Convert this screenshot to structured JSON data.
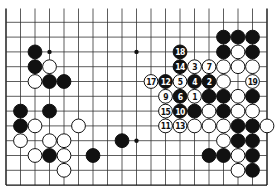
{
  "board": {
    "cols": 19,
    "rows": 13,
    "origin_x": 6,
    "origin_y": 7.5,
    "spacing_x": 14.5,
    "spacing_y": 14.8,
    "top_edge_drawn": false,
    "bottom_edge_row": 12,
    "left_edge_col": 0,
    "right_edge_col": 18,
    "first_horizontal_row": 1,
    "line_color": "#333333",
    "edge_color": "#111111",
    "stone_radius": 6.9
  },
  "star_points": [
    {
      "c": 3,
      "r": 3
    },
    {
      "c": 9,
      "r": 3
    },
    {
      "c": 9,
      "r": 9
    }
  ],
  "stones": [
    {
      "c": 2,
      "r": 3,
      "color": "black"
    },
    {
      "c": 2,
      "r": 4,
      "color": "black"
    },
    {
      "c": 3,
      "r": 4,
      "color": "white"
    },
    {
      "c": 2,
      "r": 5,
      "color": "white"
    },
    {
      "c": 3,
      "r": 5,
      "color": "black"
    },
    {
      "c": 4,
      "r": 5,
      "color": "black"
    },
    {
      "c": 15,
      "r": 2,
      "color": "black"
    },
    {
      "c": 16,
      "r": 2,
      "color": "black"
    },
    {
      "c": 17,
      "r": 2,
      "color": "black"
    },
    {
      "c": 12,
      "r": 3,
      "color": "black",
      "label": "18"
    },
    {
      "c": 15,
      "r": 3,
      "color": "black"
    },
    {
      "c": 16,
      "r": 3,
      "color": "white"
    },
    {
      "c": 17,
      "r": 3,
      "color": "black"
    },
    {
      "c": 12,
      "r": 4,
      "color": "black",
      "label": "14"
    },
    {
      "c": 13,
      "r": 4,
      "color": "white",
      "label": "3"
    },
    {
      "c": 14,
      "r": 4,
      "color": "white",
      "label": "7"
    },
    {
      "c": 15,
      "r": 4,
      "color": "white"
    },
    {
      "c": 16,
      "r": 4,
      "color": "white"
    },
    {
      "c": 17,
      "r": 4,
      "color": "white"
    },
    {
      "c": 10,
      "r": 5,
      "color": "white",
      "label": "17"
    },
    {
      "c": 11,
      "r": 5,
      "color": "black",
      "label": "12"
    },
    {
      "c": 12,
      "r": 5,
      "color": "white",
      "label": "5"
    },
    {
      "c": 13,
      "r": 5,
      "color": "black",
      "label": "4"
    },
    {
      "c": 14,
      "r": 5,
      "color": "black",
      "label": "2"
    },
    {
      "c": 15,
      "r": 5,
      "color": "white"
    },
    {
      "c": 17,
      "r": 5,
      "color": "white",
      "label": "19"
    },
    {
      "c": 11,
      "r": 6,
      "color": "white",
      "label": "9"
    },
    {
      "c": 12,
      "r": 6,
      "color": "black",
      "label": "6"
    },
    {
      "c": 13,
      "r": 6,
      "color": "white",
      "label": "1"
    },
    {
      "c": 14,
      "r": 6,
      "color": "black"
    },
    {
      "c": 15,
      "r": 6,
      "color": "black"
    },
    {
      "c": 16,
      "r": 6,
      "color": "white"
    },
    {
      "c": 17,
      "r": 6,
      "color": "black"
    },
    {
      "c": 1,
      "r": 7,
      "color": "black"
    },
    {
      "c": 3,
      "r": 7,
      "color": "black"
    },
    {
      "c": 11,
      "r": 7,
      "color": "white",
      "label": "15"
    },
    {
      "c": 12,
      "r": 7,
      "color": "black",
      "label": "10"
    },
    {
      "c": 13,
      "r": 7,
      "color": "black"
    },
    {
      "c": 14,
      "r": 7,
      "color": "white"
    },
    {
      "c": 15,
      "r": 7,
      "color": "black"
    },
    {
      "c": 16,
      "r": 7,
      "color": "white"
    },
    {
      "c": 17,
      "r": 7,
      "color": "white"
    },
    {
      "c": 1,
      "r": 8,
      "color": "black"
    },
    {
      "c": 2,
      "r": 8,
      "color": "white"
    },
    {
      "c": 5,
      "r": 8,
      "color": "white"
    },
    {
      "c": 11,
      "r": 8,
      "color": "white",
      "label": "11"
    },
    {
      "c": 12,
      "r": 8,
      "color": "white",
      "label": "13"
    },
    {
      "c": 13,
      "r": 8,
      "color": "white"
    },
    {
      "c": 14,
      "r": 8,
      "color": "white"
    },
    {
      "c": 15,
      "r": 8,
      "color": "white"
    },
    {
      "c": 16,
      "r": 8,
      "color": "black"
    },
    {
      "c": 17,
      "r": 8,
      "color": "black"
    },
    {
      "c": 18,
      "r": 8,
      "color": "white"
    },
    {
      "c": 1,
      "r": 9,
      "color": "white"
    },
    {
      "c": 3,
      "r": 9,
      "color": "white"
    },
    {
      "c": 4,
      "r": 9,
      "color": "white"
    },
    {
      "c": 8,
      "r": 9,
      "color": "black"
    },
    {
      "c": 15,
      "r": 9,
      "color": "white"
    },
    {
      "c": 16,
      "r": 9,
      "color": "black"
    },
    {
      "c": 17,
      "r": 9,
      "color": "black"
    },
    {
      "c": 2,
      "r": 10,
      "color": "white"
    },
    {
      "c": 3,
      "r": 10,
      "color": "black"
    },
    {
      "c": 4,
      "r": 10,
      "color": "white"
    },
    {
      "c": 6,
      "r": 10,
      "color": "black"
    },
    {
      "c": 14,
      "r": 10,
      "color": "black"
    },
    {
      "c": 15,
      "r": 10,
      "color": "black"
    },
    {
      "c": 16,
      "r": 10,
      "color": "white"
    },
    {
      "c": 17,
      "r": 10,
      "color": "black"
    },
    {
      "c": 4,
      "r": 11,
      "color": "white"
    },
    {
      "c": 16,
      "r": 11,
      "color": "white"
    },
    {
      "c": 17,
      "r": 11,
      "color": "black"
    }
  ]
}
